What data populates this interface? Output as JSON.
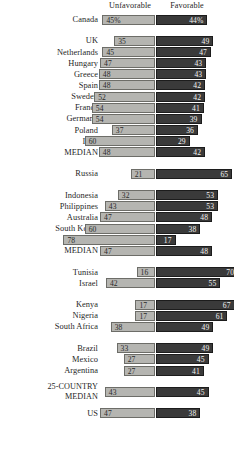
{
  "header": {
    "unfavorable_label": "Unfavorable",
    "favorable_label": "Favorable"
  },
  "style": {
    "unfavorable_color": "#b5b5b1",
    "favorable_color": "#3a3a3a",
    "background": "#ffffff"
  },
  "chart_data": {
    "type": "bar",
    "subtype": "diverging-stacked-bar",
    "title": "",
    "xlabel": "",
    "ylabel": "",
    "legend": [
      "Unfavorable",
      "Favorable"
    ],
    "legend_position": "top",
    "grid": false,
    "value_unit": "percent",
    "categories": [
      "Canada",
      "UK",
      "Netherlands",
      "Hungary",
      "Greece",
      "Spain",
      "Sweden",
      "France",
      "Germany",
      "Poland",
      "Italy",
      "MEDIAN",
      "Russia",
      "Indonesia",
      "Philippines",
      "Australia",
      "South Korea",
      "Japan",
      "MEDIAN",
      "Tunisia",
      "Israel",
      "Kenya",
      "Nigeria",
      "South Africa",
      "Brazil",
      "Mexico",
      "Argentina",
      "25-COUNTRY MEDIAN",
      "US"
    ],
    "series": [
      {
        "name": "Unfavorable",
        "values": [
          45,
          35,
          45,
          47,
          48,
          48,
          52,
          54,
          54,
          37,
          60,
          48,
          21,
          32,
          43,
          47,
          60,
          78,
          47,
          16,
          42,
          17,
          17,
          38,
          33,
          27,
          27,
          43,
          47
        ]
      },
      {
        "name": "Favorable",
        "values": [
          44,
          49,
          47,
          43,
          43,
          42,
          42,
          41,
          39,
          36,
          29,
          42,
          65,
          53,
          53,
          48,
          38,
          17,
          48,
          70,
          55,
          67,
          61,
          49,
          49,
          45,
          41,
          45,
          38
        ]
      }
    ],
    "rows": [
      {
        "label": "Canada",
        "label_lines": [
          "Canada"
        ],
        "unfavorable": 45,
        "favorable": 44,
        "unfavorable_text": "45%",
        "favorable_text": "44%",
        "group": 0
      },
      {
        "label": "UK",
        "label_lines": [
          "UK"
        ],
        "unfavorable": 35,
        "favorable": 49,
        "unfavorable_text": "35",
        "favorable_text": "49",
        "group": 1
      },
      {
        "label": "Netherlands",
        "label_lines": [
          "Netherlands"
        ],
        "unfavorable": 45,
        "favorable": 47,
        "unfavorable_text": "45",
        "favorable_text": "47",
        "group": 1
      },
      {
        "label": "Hungary",
        "label_lines": [
          "Hungary"
        ],
        "unfavorable": 47,
        "favorable": 43,
        "unfavorable_text": "47",
        "favorable_text": "43",
        "group": 1
      },
      {
        "label": "Greece",
        "label_lines": [
          "Greece"
        ],
        "unfavorable": 48,
        "favorable": 43,
        "unfavorable_text": "48",
        "favorable_text": "43",
        "group": 1
      },
      {
        "label": "Spain",
        "label_lines": [
          "Spain"
        ],
        "unfavorable": 48,
        "favorable": 42,
        "unfavorable_text": "48",
        "favorable_text": "42",
        "group": 1
      },
      {
        "label": "Sweden",
        "label_lines": [
          "Sweden"
        ],
        "unfavorable": 52,
        "favorable": 42,
        "unfavorable_text": "52",
        "favorable_text": "42",
        "group": 1
      },
      {
        "label": "France",
        "label_lines": [
          "France"
        ],
        "unfavorable": 54,
        "favorable": 41,
        "unfavorable_text": "54",
        "favorable_text": "41",
        "group": 1
      },
      {
        "label": "Germany",
        "label_lines": [
          "Germany"
        ],
        "unfavorable": 54,
        "favorable": 39,
        "unfavorable_text": "54",
        "favorable_text": "39",
        "group": 1
      },
      {
        "label": "Poland",
        "label_lines": [
          "Poland"
        ],
        "unfavorable": 37,
        "favorable": 36,
        "unfavorable_text": "37",
        "favorable_text": "36",
        "group": 1
      },
      {
        "label": "Italy",
        "label_lines": [
          "Italy"
        ],
        "unfavorable": 60,
        "favorable": 29,
        "unfavorable_text": "60",
        "favorable_text": "29",
        "group": 1
      },
      {
        "label": "MEDIAN",
        "label_lines": [
          "MEDIAN"
        ],
        "unfavorable": 48,
        "favorable": 42,
        "unfavorable_text": "48",
        "favorable_text": "42",
        "group": 1
      },
      {
        "label": "Russia",
        "label_lines": [
          "Russia"
        ],
        "unfavorable": 21,
        "favorable": 65,
        "unfavorable_text": "21",
        "favorable_text": "65",
        "group": 2
      },
      {
        "label": "Indonesia",
        "label_lines": [
          "Indonesia"
        ],
        "unfavorable": 32,
        "favorable": 53,
        "unfavorable_text": "32",
        "favorable_text": "53",
        "group": 3
      },
      {
        "label": "Philippines",
        "label_lines": [
          "Philippines"
        ],
        "unfavorable": 43,
        "favorable": 53,
        "unfavorable_text": "43",
        "favorable_text": "53",
        "group": 3
      },
      {
        "label": "Australia",
        "label_lines": [
          "Australia"
        ],
        "unfavorable": 47,
        "favorable": 48,
        "unfavorable_text": "47",
        "favorable_text": "48",
        "group": 3
      },
      {
        "label": "South Korea",
        "label_lines": [
          "South Korea"
        ],
        "unfavorable": 60,
        "favorable": 38,
        "unfavorable_text": "60",
        "favorable_text": "38",
        "group": 3
      },
      {
        "label": "Japan",
        "label_lines": [
          "Japan"
        ],
        "unfavorable": 78,
        "favorable": 17,
        "unfavorable_text": "78",
        "favorable_text": "17",
        "group": 3
      },
      {
        "label": "MEDIAN",
        "label_lines": [
          "MEDIAN"
        ],
        "unfavorable": 47,
        "favorable": 48,
        "unfavorable_text": "47",
        "favorable_text": "48",
        "group": 3
      },
      {
        "label": "Tunisia",
        "label_lines": [
          "Tunisia"
        ],
        "unfavorable": 16,
        "favorable": 70,
        "unfavorable_text": "16",
        "favorable_text": "70",
        "group": 4
      },
      {
        "label": "Israel",
        "label_lines": [
          "Israel"
        ],
        "unfavorable": 42,
        "favorable": 55,
        "unfavorable_text": "42",
        "favorable_text": "55",
        "group": 4
      },
      {
        "label": "Kenya",
        "label_lines": [
          "Kenya"
        ],
        "unfavorable": 17,
        "favorable": 67,
        "unfavorable_text": "17",
        "favorable_text": "67",
        "group": 5
      },
      {
        "label": "Nigeria",
        "label_lines": [
          "Nigeria"
        ],
        "unfavorable": 17,
        "favorable": 61,
        "unfavorable_text": "17",
        "favorable_text": "61",
        "group": 5
      },
      {
        "label": "South Africa",
        "label_lines": [
          "South Africa"
        ],
        "unfavorable": 38,
        "favorable": 49,
        "unfavorable_text": "38",
        "favorable_text": "49",
        "group": 5
      },
      {
        "label": "Brazil",
        "label_lines": [
          "Brazil"
        ],
        "unfavorable": 33,
        "favorable": 49,
        "unfavorable_text": "33",
        "favorable_text": "49",
        "group": 6
      },
      {
        "label": "Mexico",
        "label_lines": [
          "Mexico"
        ],
        "unfavorable": 27,
        "favorable": 45,
        "unfavorable_text": "27",
        "favorable_text": "45",
        "group": 6
      },
      {
        "label": "Argentina",
        "label_lines": [
          "Argentina"
        ],
        "unfavorable": 27,
        "favorable": 41,
        "unfavorable_text": "27",
        "favorable_text": "41",
        "group": 6
      },
      {
        "label": "25-COUNTRY MEDIAN",
        "label_lines": [
          "25-COUNTRY",
          "MEDIAN"
        ],
        "unfavorable": 43,
        "favorable": 45,
        "unfavorable_text": "43",
        "favorable_text": "45",
        "group": 7
      },
      {
        "label": "US",
        "label_lines": [
          "US"
        ],
        "unfavorable": 47,
        "favorable": 38,
        "unfavorable_text": "47",
        "favorable_text": "38",
        "group": 8
      }
    ]
  }
}
